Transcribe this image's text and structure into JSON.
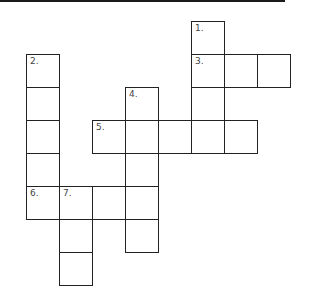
{
  "puzzle": {
    "type": "crossword",
    "cell_size": 33,
    "origin": {
      "x": 26,
      "y": 21
    },
    "cells": [
      {
        "col": 5,
        "row": 0,
        "number": "1."
      },
      {
        "col": 0,
        "row": 1,
        "number": "2."
      },
      {
        "col": 5,
        "row": 1,
        "number": "3."
      },
      {
        "col": 6,
        "row": 1,
        "number": ""
      },
      {
        "col": 7,
        "row": 1,
        "number": ""
      },
      {
        "col": 0,
        "row": 2,
        "number": ""
      },
      {
        "col": 3,
        "row": 2,
        "number": "4."
      },
      {
        "col": 5,
        "row": 2,
        "number": ""
      },
      {
        "col": 0,
        "row": 3,
        "number": ""
      },
      {
        "col": 2,
        "row": 3,
        "number": "5."
      },
      {
        "col": 3,
        "row": 3,
        "number": ""
      },
      {
        "col": 4,
        "row": 3,
        "number": ""
      },
      {
        "col": 5,
        "row": 3,
        "number": ""
      },
      {
        "col": 6,
        "row": 3,
        "number": ""
      },
      {
        "col": 0,
        "row": 4,
        "number": ""
      },
      {
        "col": 3,
        "row": 4,
        "number": ""
      },
      {
        "col": 0,
        "row": 5,
        "number": "6."
      },
      {
        "col": 1,
        "row": 5,
        "number": "7."
      },
      {
        "col": 2,
        "row": 5,
        "number": ""
      },
      {
        "col": 3,
        "row": 5,
        "number": ""
      },
      {
        "col": 1,
        "row": 6,
        "number": ""
      },
      {
        "col": 3,
        "row": 6,
        "number": ""
      },
      {
        "col": 1,
        "row": 7,
        "number": ""
      }
    ]
  }
}
